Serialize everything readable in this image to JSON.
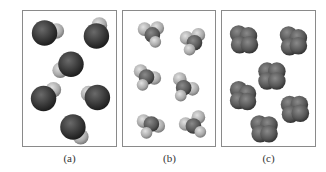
{
  "figure": {
    "panels": [
      {
        "id": "a",
        "label": "(a)",
        "description": "diatomic molecules: large dark sphere with smaller light sphere",
        "molecule_count": 6
      },
      {
        "id": "b",
        "label": "(b)",
        "description": "molecules with dark central atom and three light attached atoms",
        "molecule_count": 6
      },
      {
        "id": "c",
        "label": "(c)",
        "description": "molecules with four fused dark lobes",
        "molecule_count": 6
      }
    ],
    "colors": {
      "dark_atom": "#3a3a3a",
      "light_atom": "#b5b5b5",
      "frame": "#8a8a8a",
      "background": "#ffffff"
    }
  }
}
